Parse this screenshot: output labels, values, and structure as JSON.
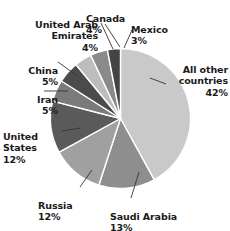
{
  "chart_data": {
    "type": "pie",
    "title": "",
    "subtitle": "",
    "xlabel": "",
    "ylabel": "",
    "legend_position": "none",
    "grid": false,
    "units": "percent",
    "total": 100,
    "categories": [
      "All other countries",
      "Saudi Arabia",
      "Russia",
      "United States",
      "Iran",
      "China",
      "United Arab Emirates",
      "Canada",
      "Mexico"
    ],
    "values": [
      42,
      13,
      12,
      12,
      5,
      5,
      4,
      4,
      3
    ],
    "colors": [
      "#c9c9c9",
      "#8e8e8e",
      "#a0a0a0",
      "#5a5a5a",
      "#7a7a7a",
      "#4b4b4b",
      "#bdbdbd",
      "#8a8a8a",
      "#444444"
    ],
    "slices": [
      {
        "label": "All other countries",
        "value": 42,
        "value_text": "42%",
        "color": "#c9c9c9"
      },
      {
        "label": "Saudi Arabia",
        "value": 13,
        "value_text": "13%",
        "color": "#8e8e8e"
      },
      {
        "label": "Russia",
        "value": 12,
        "value_text": "12%",
        "color": "#a0a0a0"
      },
      {
        "label": "United States",
        "value": 12,
        "value_text": "12%",
        "color": "#5a5a5a"
      },
      {
        "label": "Iran",
        "value": 5,
        "value_text": "5%",
        "color": "#7a7a7a"
      },
      {
        "label": "China",
        "value": 5,
        "value_text": "5%",
        "color": "#4b4b4b"
      },
      {
        "label": "United Arab Emirates",
        "value": 4,
        "value_text": "4%",
        "color": "#bdbdbd"
      },
      {
        "label": "Canada",
        "value": 4,
        "value_text": "4%",
        "color": "#8a8a8a"
      },
      {
        "label": "Mexico",
        "value": 3,
        "value_text": "3%",
        "color": "#444444"
      }
    ]
  },
  "labels": {
    "other_countries": {
      "name": "All other\ncountries",
      "pct": "42%"
    },
    "saudi_arabia": {
      "name": "Saudi Arabia",
      "pct": "13%"
    },
    "russia": {
      "name": "Russia",
      "pct": "12%"
    },
    "united_states": {
      "name": "United\nStates",
      "pct": "12%"
    },
    "iran": {
      "name": "Iran",
      "pct": "5%"
    },
    "china": {
      "name": "China",
      "pct": "5%"
    },
    "uae": {
      "name": "United Arab\nEmirates",
      "pct": "4%"
    },
    "canada": {
      "name": "Canada",
      "pct": "4%"
    },
    "mexico": {
      "name": "Mexico",
      "pct": "3%"
    }
  },
  "style": {
    "background": "#ffffff",
    "text_color": "#1a1a1a",
    "slice_separator": "#ffffff",
    "leader_line_color": "#333333"
  }
}
